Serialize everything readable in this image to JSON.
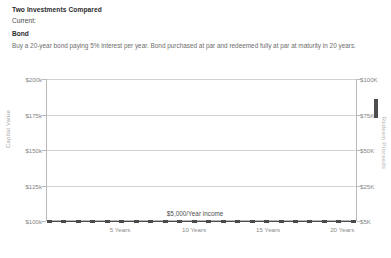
{
  "header": {
    "title": "Two Investments Compared",
    "current_label": "Current:",
    "scheme_name": "Bond",
    "description": "Buy a 20-year bond paying 5% interest per year. Bond purchased at par and redeemed fully at par at maturity in 20 years."
  },
  "chart_data": {
    "type": "line",
    "title": "",
    "xlabel": "",
    "ylabel": "Capital Value",
    "y2label": "Redeem Proceeds",
    "grid": true,
    "legend_position": "none",
    "x": [
      0,
      1,
      2,
      3,
      4,
      5,
      6,
      7,
      8,
      9,
      10,
      11,
      12,
      13,
      14,
      15,
      16,
      17,
      18,
      19,
      20
    ],
    "xtick_labels": [
      "5 Years",
      "10 Years",
      "15 Years",
      "20 Years"
    ],
    "xtick_values": [
      5,
      10,
      15,
      20
    ],
    "xlim": [
      0,
      21
    ],
    "ylim": [
      100000,
      200000
    ],
    "ytick_labels": [
      "$200k",
      "$175k",
      "$150k",
      "$125k",
      "$100k"
    ],
    "ytick_values": [
      200000,
      175000,
      150000,
      125000,
      100000
    ],
    "y2lim": [
      5000,
      100000
    ],
    "y2tick_labels": [
      "$100K",
      "$75K",
      "$50K",
      "$25K",
      "$5K"
    ],
    "y2tick_values": [
      100000,
      75000,
      50000,
      25000,
      5000
    ],
    "series": [
      {
        "name": "Bond capital value",
        "style": "dashed-with-square-markers",
        "color": "#4a4a4a",
        "annotation": "$5,000/Year income",
        "values": [
          100000,
          100000,
          100000,
          100000,
          100000,
          100000,
          100000,
          100000,
          100000,
          100000,
          100000,
          100000,
          100000,
          100000,
          100000,
          100000,
          100000,
          100000,
          100000,
          100000,
          100000
        ]
      }
    ],
    "annotations": [
      {
        "text": "$5,000/Year income",
        "x": 10,
        "y": 103000
      }
    ]
  },
  "colors": {
    "text_primary": "#2b2b2b",
    "text_muted": "#6d6d6d",
    "axis_label": "#858585",
    "gridline": "#d2d2d2",
    "series": "#4a4a4a",
    "area_fill": "#f4f4f4"
  }
}
